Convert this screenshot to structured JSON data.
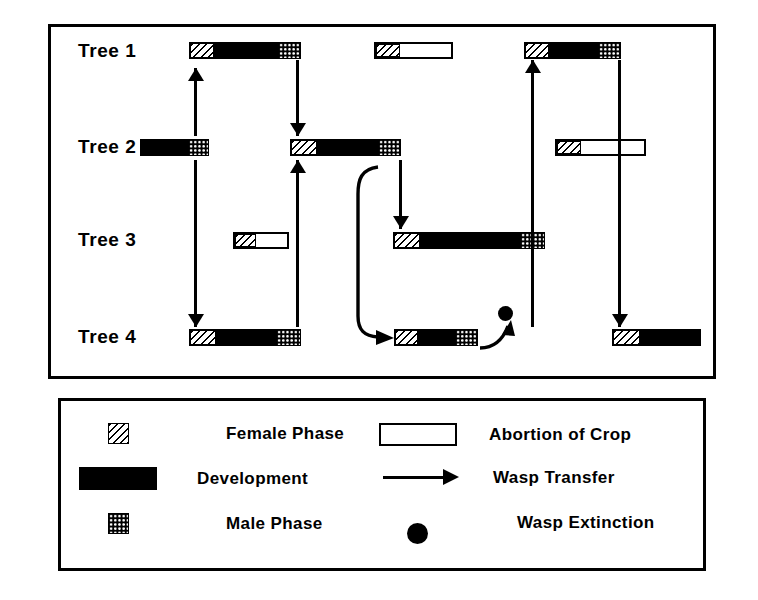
{
  "figure": {
    "type": "diagram",
    "rows": [
      {
        "id": "tree1",
        "label": "Tree 1",
        "y": 52
      },
      {
        "id": "tree2",
        "label": "Tree 2",
        "y": 148
      },
      {
        "id": "tree3",
        "label": "Tree 3",
        "y": 241
      },
      {
        "id": "tree4",
        "label": "Tree 4",
        "y": 338
      }
    ]
  },
  "bars": [
    {
      "name": "tree1-crop-1",
      "row": "tree1",
      "x": 189,
      "y": 42,
      "w": 112,
      "kind": "full",
      "female_w": 24,
      "male_w": 22
    },
    {
      "name": "tree1-crop-2",
      "row": "tree1",
      "x": 374,
      "y": 42,
      "w": 79,
      "kind": "aborted",
      "female_w": 24
    },
    {
      "name": "tree1-crop-3",
      "row": "tree1",
      "x": 524,
      "y": 42,
      "w": 97,
      "kind": "full",
      "female_w": 24,
      "male_w": 22
    },
    {
      "name": "tree2-crop-1",
      "row": "tree2",
      "x": 140,
      "y": 139,
      "w": 69,
      "kind": "dev-male",
      "male_w": 20
    },
    {
      "name": "tree2-crop-2",
      "row": "tree2",
      "x": 290,
      "y": 139,
      "w": 111,
      "kind": "full",
      "female_w": 26,
      "male_w": 22
    },
    {
      "name": "tree2-crop-3",
      "row": "tree2",
      "x": 555,
      "y": 139,
      "w": 91,
      "kind": "aborted",
      "female_w": 24
    },
    {
      "name": "tree3-crop-1",
      "row": "tree3",
      "x": 233,
      "y": 232,
      "w": 56,
      "kind": "aborted",
      "female_w": 21
    },
    {
      "name": "tree3-crop-2",
      "row": "tree3",
      "x": 393,
      "y": 232,
      "w": 152,
      "kind": "full",
      "female_w": 26,
      "male_w": 24
    },
    {
      "name": "tree4-crop-1",
      "row": "tree4",
      "x": 189,
      "y": 329,
      "w": 112,
      "kind": "full",
      "female_w": 26,
      "male_w": 24
    },
    {
      "name": "tree4-crop-2",
      "row": "tree4",
      "x": 394,
      "y": 329,
      "w": 84,
      "kind": "full",
      "female_w": 23,
      "male_w": 22
    },
    {
      "name": "tree4-crop-3",
      "row": "tree4",
      "x": 612,
      "y": 329,
      "w": 89,
      "kind": "dev-female",
      "female_w": 27
    }
  ],
  "connectors": [
    {
      "name": "transfer-tree2-to-tree1",
      "from": "tree2-crop-1",
      "to": "tree1-crop-1",
      "x": 194,
      "y1": 68,
      "y2": 136,
      "dir": "up"
    },
    {
      "name": "transfer-tree1-to-tree2",
      "from": "tree1-crop-1",
      "to": "tree2-crop-2",
      "x": 296,
      "y1": 60,
      "y2": 136,
      "dir": "down"
    },
    {
      "name": "transfer-tree4-to-tree2",
      "from": "tree4-crop-1",
      "to": "tree2-crop-2",
      "x": 296,
      "y1": 160,
      "y2": 327,
      "dir": "up"
    },
    {
      "name": "transfer-tree2-to-tree4",
      "from": "tree2-crop-1",
      "to": "tree4-crop-1",
      "x": 194,
      "y1": 160,
      "y2": 327,
      "dir": "down"
    },
    {
      "name": "transfer-tree2-to-tree3",
      "from": "tree2-crop-2",
      "to": "tree3-crop-2",
      "x": 399,
      "y1": 160,
      "y2": 229,
      "dir": "down"
    },
    {
      "name": "transfer-tree4-to-tree1",
      "from": "tree4-crop-3",
      "to": "tree1-crop-3",
      "x": 531,
      "y1": 60,
      "y2": 327,
      "dir": "up"
    },
    {
      "name": "transfer-tree1-to-tree4",
      "from": "tree1-crop-3",
      "to": "tree4-crop-3",
      "x": 618,
      "y1": 60,
      "y2": 327,
      "dir": "down"
    }
  ],
  "curved_connectors": [
    {
      "name": "transfer-tree2-curve-to-tree4",
      "path": "M 22 3 C 5 5 2 16 2 30 L 2 152 C 2 166 8 172 22 173"
    },
    {
      "name": "transfer-tree4-to-extinction",
      "path": "M 0 26 C 12 26 22 20 28 4"
    }
  ],
  "extinction": {
    "name": "wasp-extinction-dot",
    "x": 498,
    "y": 306,
    "d": 15
  },
  "legend": {
    "left_column": [
      {
        "name": "legend-female-phase",
        "swatch": "female",
        "label": "Female Phase"
      },
      {
        "name": "legend-development",
        "swatch": "dev",
        "label": "Development"
      },
      {
        "name": "legend-male-phase",
        "swatch": "male",
        "label": "Male Phase"
      }
    ],
    "right_column": [
      {
        "name": "legend-abortion-of-crop",
        "swatch": "open",
        "label": "Abortion of Crop"
      },
      {
        "name": "legend-wasp-transfer",
        "swatch": "arrow",
        "label": "Wasp Transfer"
      },
      {
        "name": "legend-wasp-extinction",
        "swatch": "dot",
        "label": "Wasp Extinction"
      }
    ]
  },
  "colors": {
    "ink": "#000000",
    "paper": "#ffffff"
  }
}
